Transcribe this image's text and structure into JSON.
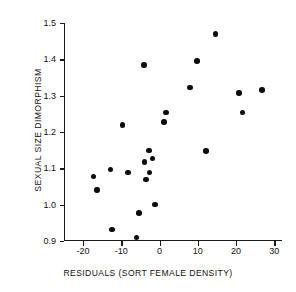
{
  "chart_data": {
    "type": "scatter",
    "title": "",
    "xlabel": "RESIDUALS (SORT FEMALE DENSITY)",
    "ylabel": "SEXUAL SIZE DIMORPHISM",
    "xlim": [
      -25,
      32
    ],
    "ylim": [
      0.9,
      1.5
    ],
    "grid": false,
    "legend": null,
    "xticks": [
      -20,
      -10,
      0,
      10,
      20,
      30
    ],
    "xtick_labels": [
      "-20",
      "-10",
      "0",
      "10",
      "20",
      "30"
    ],
    "yticks": [
      0.9,
      1.0,
      1.1,
      1.2,
      1.3,
      1.4,
      1.5
    ],
    "ytick_labels": [
      "0.9",
      "1.0",
      "1.1",
      "1.2",
      "1.3",
      "1.4",
      "1.5"
    ],
    "points": [
      {
        "x": -17.3,
        "y": 1.078
      },
      {
        "x": -16.3,
        "y": 1.04
      },
      {
        "x": -12.8,
        "y": 1.097
      },
      {
        "x": -12.5,
        "y": 0.932
      },
      {
        "x": -9.7,
        "y": 1.219
      },
      {
        "x": -8.2,
        "y": 1.089
      },
      {
        "x": -6.0,
        "y": 0.91
      },
      {
        "x": -5.4,
        "y": 0.977
      },
      {
        "x": -4.1,
        "y": 1.385
      },
      {
        "x": -3.9,
        "y": 1.118
      },
      {
        "x": -3.6,
        "y": 1.069
      },
      {
        "x": -2.8,
        "y": 1.149
      },
      {
        "x": -2.6,
        "y": 1.088
      },
      {
        "x": -1.9,
        "y": 1.127
      },
      {
        "x": -1.2,
        "y": 1.0
      },
      {
        "x": 1.2,
        "y": 1.228
      },
      {
        "x": 1.6,
        "y": 1.254
      },
      {
        "x": 8.0,
        "y": 1.322
      },
      {
        "x": 9.8,
        "y": 1.396
      },
      {
        "x": 12.2,
        "y": 1.148
      },
      {
        "x": 14.6,
        "y": 1.47
      },
      {
        "x": 20.7,
        "y": 1.307
      },
      {
        "x": 21.7,
        "y": 1.254
      },
      {
        "x": 26.8,
        "y": 1.316
      }
    ]
  },
  "marker": {
    "shape": "filled-circle",
    "color": "#0d0d0d",
    "size_px": 5.6
  },
  "axis_color": "#1a1a1a"
}
